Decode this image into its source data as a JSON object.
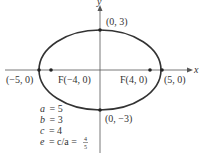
{
  "diagram": {
    "type": "ellipse",
    "axes": {
      "x_label": "x",
      "y_label": "y"
    },
    "points": {
      "top_vertex": "(0, 3)",
      "bottom_vertex": "(0, −3)",
      "left_vertex": "(−5, 0)",
      "right_vertex": "(5, 0)",
      "left_focus": "F(−4, 0)",
      "right_focus": "F(4, 0)"
    },
    "parameters": {
      "a": {
        "name": "a",
        "value": "= 5"
      },
      "b": {
        "name": "b",
        "value": "= 3"
      },
      "c": {
        "name": "c",
        "value": "= 4"
      },
      "e": {
        "name": "e",
        "formula": "= c/a =",
        "numerator": "4",
        "denominator": "5"
      }
    },
    "colors": {
      "curve": "#333333",
      "axis": "#555555",
      "text": "#333333"
    }
  }
}
